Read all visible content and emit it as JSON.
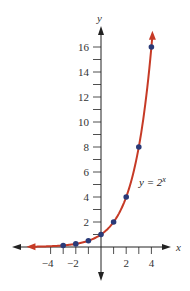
{
  "chart_data": {
    "type": "line",
    "title": "",
    "xlabel": "x",
    "ylabel": "y",
    "xlim": [
      -5.5,
      5.5
    ],
    "ylim": [
      -2.5,
      17.5
    ],
    "grid": false,
    "x_ticks": [
      -4,
      -3,
      -2,
      -1,
      1,
      2,
      3,
      4
    ],
    "x_tick_labels": [
      "−4",
      "−2",
      "2",
      "4"
    ],
    "x_tick_label_values": [
      -4,
      -2,
      2,
      4
    ],
    "y_ticks": [
      1,
      2,
      3,
      4,
      5,
      6,
      7,
      8,
      9,
      10,
      11,
      12,
      13,
      14,
      15,
      16
    ],
    "y_tick_labels": [
      "2",
      "4",
      "6",
      "8",
      "10",
      "12",
      "14",
      "16"
    ],
    "y_tick_label_values": [
      2,
      4,
      6,
      8,
      10,
      12,
      14,
      16
    ],
    "series": [
      {
        "name": "y = 2^x",
        "label_text": "y = 2",
        "label_superscript": "x",
        "function": "2^x",
        "color": "#c63a26",
        "point_color": "#2a3a78",
        "points": [
          {
            "x": -3,
            "y": 0.125
          },
          {
            "x": -2,
            "y": 0.25
          },
          {
            "x": -1,
            "y": 0.5
          },
          {
            "x": 0,
            "y": 1
          },
          {
            "x": 1,
            "y": 2
          },
          {
            "x": 2,
            "y": 4
          },
          {
            "x": 3,
            "y": 8
          },
          {
            "x": 4,
            "y": 16
          }
        ]
      }
    ],
    "annotations": [
      {
        "text": "y = 2^x",
        "near": {
          "x": 3.2,
          "y": 5
        }
      }
    ]
  },
  "colors": {
    "axis": "#222222",
    "curve": "#c63a26",
    "points": "#2a3a78"
  }
}
